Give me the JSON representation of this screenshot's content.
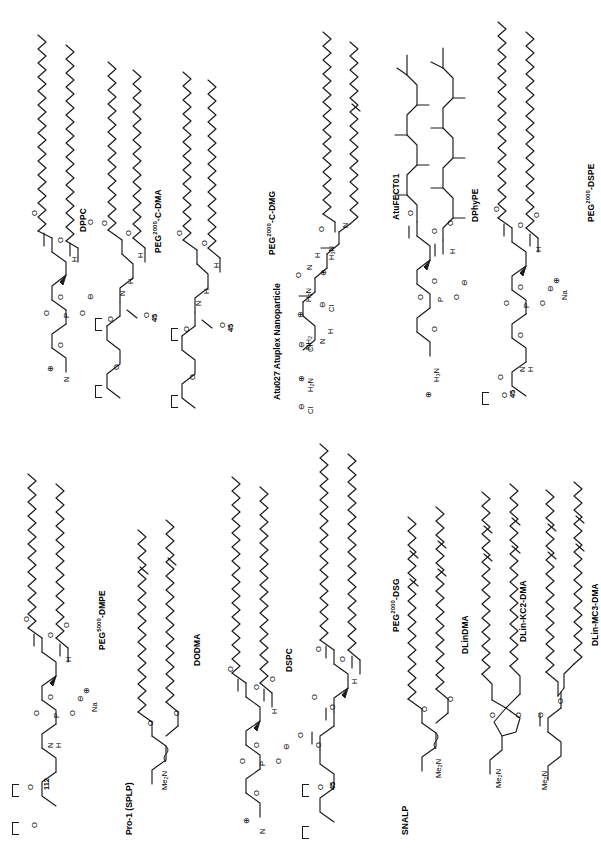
{
  "figure": {
    "orientation": "rotated-90",
    "background_color": "#ffffff",
    "line_color": "#1a1a1a"
  },
  "sections": [
    {
      "id": "atu027",
      "label": "Atu027 Atuplex Nanoparticle"
    },
    {
      "id": "pro1",
      "label": "Pro-1  (SPLP)"
    },
    {
      "id": "snalp",
      "label": "SNALP"
    }
  ],
  "structures": [
    {
      "id": "dppc",
      "name": "DPPC",
      "name_html": "DPPC",
      "section": "atu027",
      "class": "phosphatidylcholine",
      "tails": 2,
      "tail_carbons": 16,
      "unsaturations": 0,
      "headgroup": "phosphocholine",
      "atom_labels": [
        "O",
        "O",
        "O",
        "O",
        "P",
        "O",
        "H",
        "N"
      ],
      "charges": [
        "-",
        "+"
      ]
    },
    {
      "id": "peg2000-c-dma",
      "name": "PEG2000-C-DMA",
      "name_html": "PEG<sup>2000</sup>-C-DMA",
      "section": "atu027",
      "class": "pegylated lipid",
      "tails": 2,
      "tail_carbons": 14,
      "unsaturations": 0,
      "headgroup": "carbamate-PEG",
      "repeat_label": "45",
      "atom_labels": [
        "O",
        "O",
        "H",
        "N",
        "H",
        "O",
        "O",
        "O"
      ],
      "charges": []
    },
    {
      "id": "peg2000-c-dmg",
      "name": "PEG2000-C-DMG",
      "name_html": "PEG<sup>2000</sup>-C-DMG",
      "section": "atu027",
      "class": "pegylated lipid",
      "tails": 2,
      "tail_carbons": 14,
      "unsaturations": 0,
      "headgroup": "carbamate-PEG",
      "repeat_label": "45",
      "atom_labels": [
        "O",
        "O",
        "H",
        "N",
        "H",
        "O",
        "O",
        "O"
      ],
      "charges": []
    },
    {
      "id": "atufect01",
      "name": "AtuFECT01",
      "name_html": "AtuFECT01",
      "section": "atu027",
      "class": "cationic lipid",
      "tails": 2,
      "tail_carbons": 18,
      "unsaturations": 1,
      "headgroup": "ornithine-arginine amide",
      "atom_labels": [
        "O",
        "N",
        "H",
        "O",
        "N",
        "H",
        "H",
        "NH2",
        "H3N",
        "H3N",
        "H2N",
        "Cl",
        "Cl",
        "Cl"
      ],
      "charges": [
        "+",
        "+",
        "+",
        "-",
        "-",
        "-"
      ]
    },
    {
      "id": "dphype",
      "name": "DPhyPE",
      "name_html": "DPhyPE",
      "section": "atu027",
      "class": "phosphatidylethanolamine",
      "tails": 2,
      "tail_carbons": 16,
      "unsaturations": 0,
      "branched": true,
      "headgroup": "phosphoethanolamine",
      "atom_labels": [
        "O",
        "O",
        "O",
        "O",
        "P",
        "O",
        "H",
        "H3N"
      ],
      "charges": [
        "-",
        "+"
      ]
    },
    {
      "id": "peg2000-dspe",
      "name": "PEG2000-DSPE",
      "name_html": "PEG<sup>2000</sup>-DSPE",
      "section": "atu027",
      "class": "pegylated phospholipid",
      "tails": 2,
      "tail_carbons": 18,
      "unsaturations": 0,
      "headgroup": "phosphoethanolamine-PEG",
      "repeat_label": "45",
      "counterion": "Na",
      "atom_labels": [
        "O",
        "O",
        "O",
        "O",
        "P",
        "O",
        "H",
        "N",
        "H",
        "O",
        "O",
        "Na"
      ],
      "charges": [
        "-",
        "+"
      ]
    },
    {
      "id": "peg5000-dmpe",
      "name": "PEG5000-DMPE",
      "name_html": "PEG<sup>5000</sup>-DMPE",
      "section": "pro1",
      "class": "pegylated phospholipid",
      "tails": 2,
      "tail_carbons": 14,
      "unsaturations": 0,
      "headgroup": "phosphoethanolamine-PEG",
      "repeat_label": "112",
      "counterion": "Na",
      "atom_labels": [
        "O",
        "O",
        "O",
        "O",
        "P",
        "O",
        "H",
        "N",
        "H",
        "O",
        "O",
        "Na"
      ],
      "charges": [
        "-",
        "+"
      ]
    },
    {
      "id": "dodma",
      "name": "DODMA",
      "name_html": "DODMA",
      "section": "pro1",
      "class": "cationic lipid",
      "tails": 2,
      "tail_carbons": 18,
      "unsaturations": 1,
      "headgroup": "dimethylamino-propanediol diether",
      "atom_labels": [
        "O",
        "O",
        "Me2N"
      ],
      "charges": []
    },
    {
      "id": "dspc",
      "name": "DSPC",
      "name_html": "DSPC",
      "section": "pro1",
      "class": "phosphatidylcholine",
      "tails": 2,
      "tail_carbons": 18,
      "unsaturations": 0,
      "headgroup": "phosphocholine",
      "atom_labels": [
        "O",
        "O",
        "O",
        "O",
        "P",
        "O",
        "H",
        "N"
      ],
      "charges": [
        "-",
        "+"
      ]
    },
    {
      "id": "peg2000-dsg",
      "name": "PEG2000-DSG",
      "name_html": "PEG<sup>2000</sup>-DSG",
      "section": "snalp",
      "class": "pegylated lipid",
      "tails": 2,
      "tail_carbons": 18,
      "unsaturations": 0,
      "headgroup": "succinyl-PEG glyceride",
      "repeat_label": "45",
      "atom_labels": [
        "O",
        "O",
        "O",
        "O",
        "H",
        "O",
        "O",
        "O",
        "O"
      ],
      "charges": []
    },
    {
      "id": "dlindma",
      "name": "DLinDMA",
      "name_html": "DLinDMA",
      "section": "snalp",
      "class": "ionizable cationic lipid",
      "tails": 2,
      "tail_carbons": 18,
      "unsaturations": 2,
      "headgroup": "dimethylamino-propanediol diether",
      "atom_labels": [
        "O",
        "O",
        "Me2N"
      ],
      "charges": []
    },
    {
      "id": "dlin-kc2-dma",
      "name": "DLin-KC2-DMA",
      "name_html": "DLin-KC2-DMA",
      "section": "snalp",
      "class": "ionizable cationic lipid",
      "tails": 2,
      "tail_carbons": 18,
      "unsaturations": 2,
      "headgroup": "dioxolane dimethylaminopropyl",
      "atom_labels": [
        "O",
        "O",
        "Me2N"
      ],
      "charges": []
    },
    {
      "id": "dlin-mc3-dma",
      "name": "DLin-MC3-DMA",
      "name_html": "DLin-MC3-DMA",
      "section": "snalp",
      "class": "ionizable cationic lipid",
      "tails": 2,
      "tail_carbons": 18,
      "unsaturations": 2,
      "headgroup": "dimethylaminobutyrate ester",
      "atom_labels": [
        "O",
        "O",
        "Me2N"
      ],
      "charges": []
    }
  ]
}
